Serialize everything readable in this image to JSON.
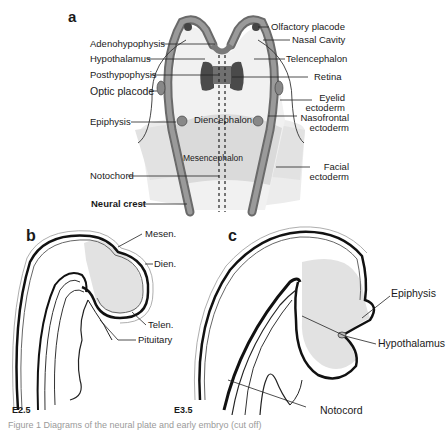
{
  "panel_a": {
    "letter": "a",
    "left_labels": [
      "Adenohypophysis",
      "Hypothalamus",
      "Posthypophysis",
      "Optic placode",
      "Epiphysis",
      "Notochord",
      "Neural crest"
    ],
    "right_labels": [
      "Olfactory placode",
      "Nasal Cavity",
      "Telencephalon",
      "Retina",
      "Eyelid ectoderm",
      "Nasofrontal ectoderm",
      "Facial ectoderm"
    ],
    "inner_labels": [
      "Diencephalon",
      "Mesencephalon"
    ]
  },
  "panel_b": {
    "letter": "b",
    "labels": [
      "Mesen.",
      "Dien.",
      "Telen.",
      "Pituitary"
    ],
    "stage": "E2.5"
  },
  "panel_c": {
    "letter": "c",
    "labels": [
      "Epiphysis",
      "Hypothalamus",
      "Notocord"
    ],
    "stage": "E3.5"
  },
  "caption": "Figure 1  Diagrams of the neural plate and early embryo (cut off)",
  "colors": {
    "wall": "#8a8a8a",
    "wall_dark": "#555555",
    "brain_fill": "#e6e6e6",
    "mesen_fill": "#d6d6d6",
    "retina": "#4a4a4a",
    "text": "#1a1a1a"
  }
}
